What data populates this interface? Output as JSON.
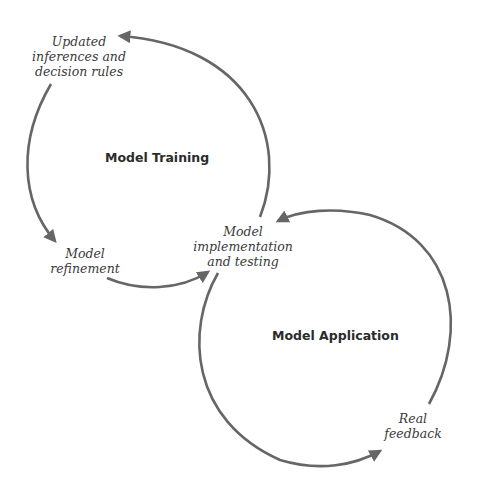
{
  "diagram": {
    "stroke_color": "#666666",
    "cycles": [
      {
        "id": "training",
        "title": "Model Training"
      },
      {
        "id": "application",
        "title": "Model Application"
      }
    ],
    "nodes": {
      "updated": "Updated\ninferences and\ndecision rules",
      "refinement": "Model\nrefinement",
      "implementation": "Model\nimplementation\nand testing",
      "feedback": "Real\nfeedback"
    },
    "edges": [
      {
        "from": "Model implementation and testing",
        "to": "Updated inferences and decision rules"
      },
      {
        "from": "Updated inferences and decision rules",
        "to": "Model refinement"
      },
      {
        "from": "Model refinement",
        "to": "Model implementation and testing"
      },
      {
        "from": "Model implementation and testing",
        "to": "Real feedback"
      },
      {
        "from": "Real feedback",
        "to": "Model implementation and testing"
      }
    ]
  }
}
